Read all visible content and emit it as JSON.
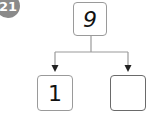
{
  "problem": {
    "number_badge": "21"
  },
  "number_bond": {
    "whole": "9",
    "parts": [
      {
        "value": "1"
      },
      {
        "value": ""
      }
    ]
  },
  "colors": {
    "badge": "#8a8a8a",
    "box_border": "#9a9a9a",
    "answer_box_border": "#6a6a6a",
    "line": "#9a9a9a",
    "arrow": "#222222"
  }
}
